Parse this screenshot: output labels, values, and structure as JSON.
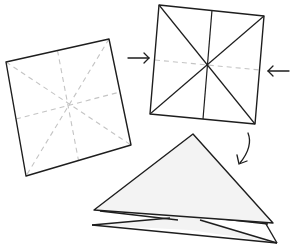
{
  "diagram": {
    "title": "",
    "type": "origami folding instructions",
    "colors": {
      "edge": "#1e1e1e",
      "crease_dashed": "#c4c4c4",
      "paper": "#ffffff",
      "paper_shaded": "#f3f3f3"
    },
    "steps": [
      {
        "id": "step-1",
        "description": "Square sheet with dashed crease lines (two diagonals, two midlines)",
        "corners": [
          [
            6,
            62
          ],
          [
            109,
            39
          ],
          [
            131,
            145
          ],
          [
            26,
            176
          ]
        ],
        "creases": "dashed"
      },
      {
        "id": "step-2",
        "description": "Square with solid diagonal and vertical creases, dashed horizontal midline; arrows push sides inward",
        "corners": [
          [
            159,
            5
          ],
          [
            264,
            16
          ],
          [
            255,
            124
          ],
          [
            150,
            114
          ]
        ],
        "creases": "solid diagonals + vertical, dashed horizontal"
      },
      {
        "id": "step-3",
        "description": "Collapsed into layered triangle (waterbomb base)",
        "apex": [
          193,
          134
        ],
        "layers": 2
      }
    ],
    "arrows": [
      {
        "id": "arrow-step1-to-step2",
        "direction": "right"
      },
      {
        "id": "arrow-push-left",
        "direction": "left"
      },
      {
        "id": "arrow-curve-down",
        "direction": "down"
      }
    ]
  }
}
